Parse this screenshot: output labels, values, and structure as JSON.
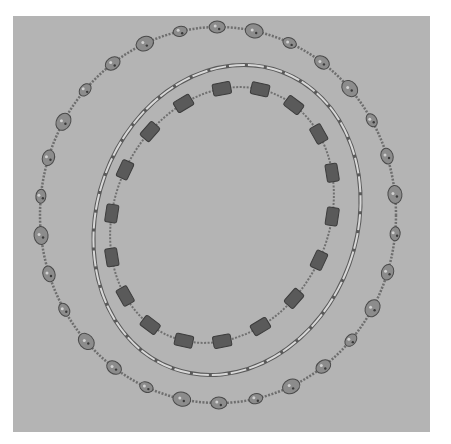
{
  "image": {
    "subject": "Three necklaces laid in nested ovals on a gray background",
    "background_color": "#b4b4b4",
    "page_color": "#ffffff",
    "necklaces": [
      {
        "name": "outer",
        "description": "Speckled stone nugget beads on a chain",
        "bead_color": "#8c8c8c",
        "chain_color": "#6e6e6e",
        "center": [
          218,
          215
        ],
        "radius": [
          178,
          188
        ],
        "rotation": 0,
        "bead_count": 30
      },
      {
        "name": "middle",
        "description": "Long silver tube beads",
        "bead_color": "#d8d8d8",
        "outline_color": "#5a5a5a",
        "center": [
          227,
          220
        ],
        "radius": [
          130,
          158
        ],
        "rotation": 20
      },
      {
        "name": "inner",
        "description": "Dark rectangular beads on a chain",
        "bead_color": "#5a5a5a",
        "chain_color": "#707070",
        "center": [
          222,
          215
        ],
        "radius": [
          107,
          132
        ],
        "rotation": 25,
        "bead_count": 18
      }
    ]
  }
}
